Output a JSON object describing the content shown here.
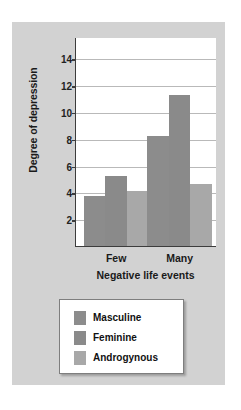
{
  "chart_data": {
    "type": "bar",
    "title": "",
    "xlabel": "Negative life events",
    "ylabel": "Degree of depression",
    "categories": [
      "Few",
      "Many"
    ],
    "series": [
      {
        "name": "Masculine",
        "values": [
          3.7,
          8.2
        ],
        "color": "#8c8c8c"
      },
      {
        "name": "Feminine",
        "values": [
          5.2,
          11.3
        ],
        "color": "#8a8a8a"
      },
      {
        "name": "Androgynous",
        "values": [
          4.1,
          4.6
        ],
        "color": "#a8a8a8"
      }
    ],
    "yticks": [
      2,
      4,
      6,
      8,
      10,
      12,
      14
    ],
    "ylim": [
      0,
      15.6
    ],
    "grid": true,
    "legend_position": "below"
  },
  "legend": {
    "items": [
      {
        "label": "Masculine"
      },
      {
        "label": "Feminine"
      },
      {
        "label": "Androgynous"
      }
    ]
  },
  "colors": {
    "panel_background": "#d2d2d2",
    "plot_background": "#ffffff",
    "axis": "#3c3c3c",
    "gridline": "#b9b9b9",
    "text": "#1a1a1a"
  }
}
